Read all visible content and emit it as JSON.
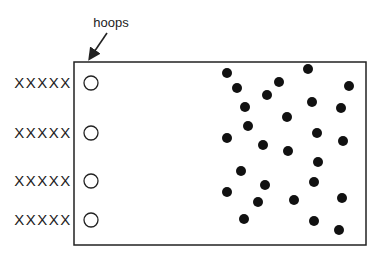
{
  "diagram": {
    "callout_label": "hoops",
    "row_label": "XXXXX",
    "colors": {
      "stroke": "#222222",
      "dot": "#111111",
      "background": "#ffffff"
    },
    "field": {
      "x": 74,
      "y": 62,
      "width": 292,
      "height": 183
    },
    "rows": [
      {
        "label": "XXXXX",
        "y": 83
      },
      {
        "label": "XXXXX",
        "y": 133
      },
      {
        "label": "XXXXX",
        "y": 181
      },
      {
        "label": "XXXXX",
        "y": 220
      }
    ],
    "hoop_x": 91,
    "hoop_radius": 7,
    "dots": [
      [
        227,
        73
      ],
      [
        237,
        88
      ],
      [
        279,
        82
      ],
      [
        308,
        69
      ],
      [
        349,
        86
      ],
      [
        267,
        95
      ],
      [
        245,
        107
      ],
      [
        312,
        102
      ],
      [
        341,
        108
      ],
      [
        287,
        117
      ],
      [
        248,
        126
      ],
      [
        227,
        138
      ],
      [
        263,
        145
      ],
      [
        317,
        133
      ],
      [
        343,
        141
      ],
      [
        288,
        151
      ],
      [
        318,
        162
      ],
      [
        241,
        171
      ],
      [
        265,
        185
      ],
      [
        314,
        182
      ],
      [
        227,
        192
      ],
      [
        258,
        202
      ],
      [
        294,
        200
      ],
      [
        342,
        198
      ],
      [
        244,
        219
      ],
      [
        314,
        221
      ],
      [
        339,
        230
      ]
    ]
  }
}
